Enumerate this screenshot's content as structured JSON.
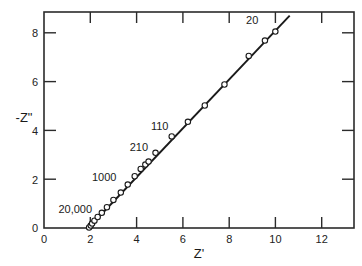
{
  "chart_data": {
    "type": "scatter",
    "title": "",
    "subtitle": "",
    "xlabel": "Z'",
    "ylabel": "-Z\"",
    "xlim": [
      0,
      13.4
    ],
    "ylim": [
      0,
      8.85
    ],
    "grid": false,
    "legend": null,
    "xticks": [
      0,
      2,
      4,
      6,
      8,
      10,
      12
    ],
    "xticklabels": [
      "0",
      "2",
      "4",
      "6",
      "8",
      "10",
      "12"
    ],
    "yticks": [
      0,
      2,
      4,
      6,
      8
    ],
    "yticklabels": [
      "0",
      "2",
      "4",
      "6",
      "8"
    ],
    "marker": "open-circle",
    "line": "straight-fit-line",
    "series": [
      {
        "name": "impedance",
        "x": [
          1.95,
          2.02,
          2.08,
          2.18,
          2.32,
          2.5,
          2.72,
          3.0,
          3.32,
          3.62,
          3.92,
          4.18,
          4.38,
          4.52,
          4.82,
          5.52,
          6.22,
          6.95,
          7.8,
          8.85,
          9.55,
          10.0
        ],
        "y": [
          0.02,
          0.1,
          0.18,
          0.3,
          0.45,
          0.62,
          0.85,
          1.15,
          1.45,
          1.78,
          2.12,
          2.42,
          2.6,
          2.72,
          3.08,
          3.75,
          4.35,
          5.02,
          5.88,
          7.05,
          7.68,
          8.05
        ]
      }
    ],
    "fit_line": {
      "x0": 1.92,
      "y0": 0.0,
      "x1": 10.62,
      "y1": 8.7
    },
    "annotations": [
      {
        "text": "20,000",
        "x": 1.35,
        "y": 0.62,
        "anchor": "end-left",
        "points_to": [
          1.95,
          0.02
        ]
      },
      {
        "text": "1000",
        "x": 2.6,
        "y": 1.92,
        "anchor": "end-left",
        "points_to": [
          3.32,
          1.45
        ]
      },
      {
        "text": "210",
        "x": 4.1,
        "y": 3.15,
        "anchor": "end-left",
        "points_to": [
          4.52,
          2.72
        ]
      },
      {
        "text": "110",
        "x": 5.0,
        "y": 4.02,
        "anchor": "end-left",
        "points_to": [
          5.52,
          3.75
        ]
      },
      {
        "text": "20",
        "x": 9.0,
        "y": 8.35,
        "anchor": "end-left",
        "points_to": [
          10.0,
          8.05
        ]
      }
    ]
  },
  "figure": {
    "axis_x_title": "Z'",
    "axis_y_title": "-Z\"",
    "x_tick_labels": [
      "0",
      "2",
      "4",
      "6",
      "8",
      "10",
      "12"
    ],
    "y_tick_labels": [
      "0",
      "2",
      "4",
      "6",
      "8"
    ],
    "point_labels": [
      "20,000",
      "1000",
      "210",
      "110",
      "20"
    ],
    "colors": {
      "axis": "#2b2b2b",
      "line": "#1a1a1a",
      "marker_fill": "#ffffff",
      "marker_stroke": "#1a1a1a",
      "text": "#1a1a1a",
      "background": "#ffffff"
    }
  }
}
